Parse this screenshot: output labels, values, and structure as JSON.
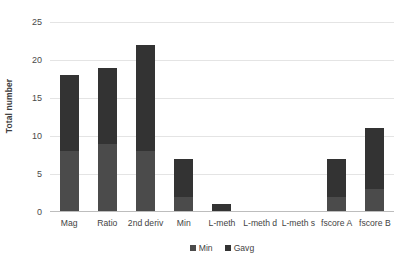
{
  "chart_data": {
    "type": "bar",
    "subtype": "stacked-bar",
    "title": "",
    "xlabel": "",
    "ylabel": "Total number",
    "ylim": [
      0,
      25
    ],
    "yticks": [
      0,
      5,
      10,
      15,
      20,
      25
    ],
    "ytick_labels": [
      "0",
      "5",
      "10",
      "15",
      "20",
      "25"
    ],
    "grid": "horizontal",
    "legend_position": "bottom-center",
    "categories": [
      "Mag",
      "Ratio",
      "2nd deriv",
      "Min",
      "L-meth",
      "L-meth d",
      "L-meth s",
      "fscore A",
      "fscore B"
    ],
    "series": [
      {
        "name": "Min",
        "color": "#4b4b4b",
        "values": [
          8,
          9,
          8,
          2,
          0,
          0,
          0,
          2,
          3
        ]
      },
      {
        "name": "Gavg",
        "color": "#333333",
        "values": [
          10,
          10,
          14,
          5,
          1,
          0,
          0,
          5,
          8
        ]
      }
    ],
    "totals": [
      18,
      19,
      22,
      7,
      1,
      0,
      0,
      7,
      11
    ]
  },
  "axis": {
    "y_title": "Total number"
  }
}
